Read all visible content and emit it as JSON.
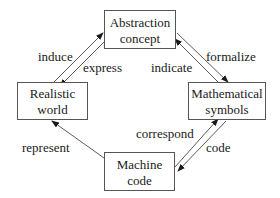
{
  "diagram": {
    "nodes": {
      "abstraction": {
        "line1": "Abstraction",
        "line2": "concept"
      },
      "realistic": {
        "line1": "Realistic",
        "line2": "world"
      },
      "mathematical": {
        "line1": "Mathematical",
        "line2": "symbols"
      },
      "machine": {
        "line1": "Machine",
        "line2": "code"
      }
    },
    "edges": {
      "induce": {
        "label": "induce",
        "from": "Realistic world",
        "to": "Abstraction concept"
      },
      "express": {
        "label": "express",
        "from": "Abstraction concept",
        "to": "Realistic world"
      },
      "formalize": {
        "label": "formalize",
        "from": "Abstraction concept",
        "to": "Mathematical symbols"
      },
      "indicate": {
        "label": "indicate",
        "from": "Mathematical symbols",
        "to": "Abstraction concept"
      },
      "correspond": {
        "label": "correspond",
        "from": "Machine code",
        "to": "Mathematical symbols"
      },
      "code": {
        "label": "code",
        "from": "Mathematical symbols",
        "to": "Machine code"
      },
      "represent": {
        "label": "represent",
        "from": "Machine code",
        "to": "Realistic world"
      }
    }
  }
}
